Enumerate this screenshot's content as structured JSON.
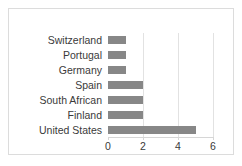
{
  "chart_data": {
    "type": "bar",
    "orientation": "horizontal",
    "title": "",
    "xlabel": "",
    "ylabel": "",
    "categories": [
      "Switzerland",
      "Portugal",
      "Germany",
      "Spain",
      "South African",
      "Finland",
      "United States"
    ],
    "values": [
      1,
      1,
      1,
      2,
      2,
      2,
      5
    ],
    "xlim": [
      0,
      6
    ],
    "xticks": [
      0,
      2,
      4,
      6
    ],
    "xtick_labels": [
      "0",
      "2",
      "4",
      "6"
    ],
    "grid": true,
    "grid_axis": "x",
    "legend": null,
    "bar_color": "#878787",
    "grid_color": "#e2e2e2",
    "text_color": "#3a3a3a",
    "border_color": "#dcdcdc",
    "background": "#ffffff"
  }
}
